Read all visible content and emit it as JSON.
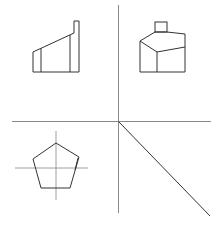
{
  "diagram": {
    "type": "orthographic-projection",
    "colors": {
      "background": "#ffffff",
      "axis": "#8a8a8a",
      "outline": "#333333",
      "centerline": "#888888"
    },
    "views": [
      {
        "name": "front-view",
        "quadrant": "top-left"
      },
      {
        "name": "side-view",
        "quadrant": "top-right"
      },
      {
        "name": "top-view",
        "quadrant": "bottom-left",
        "shape": "pentagon"
      },
      {
        "name": "projection-miter-line",
        "quadrant": "bottom-right"
      }
    ]
  }
}
